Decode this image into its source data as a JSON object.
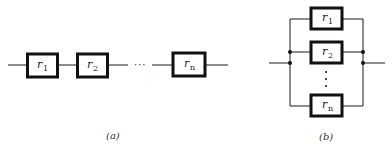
{
  "figure": {
    "panels": [
      {
        "id": "a",
        "caption": "(a)",
        "type": "series",
        "elements": [
          {
            "label": "r",
            "subscript": "1"
          },
          {
            "label": "r",
            "subscript": "2"
          },
          {
            "label": "r",
            "subscript": "n"
          }
        ],
        "ellipsis": "···"
      },
      {
        "id": "b",
        "caption": "(b)",
        "type": "parallel",
        "elements": [
          {
            "label": "r",
            "subscript": "1"
          },
          {
            "label": "r",
            "subscript": "2"
          },
          {
            "label": "r",
            "subscript": "n"
          }
        ],
        "ellipsis": "⋮"
      }
    ]
  },
  "colors": {
    "line": "#1a1a1a",
    "background": "#ffffff"
  }
}
